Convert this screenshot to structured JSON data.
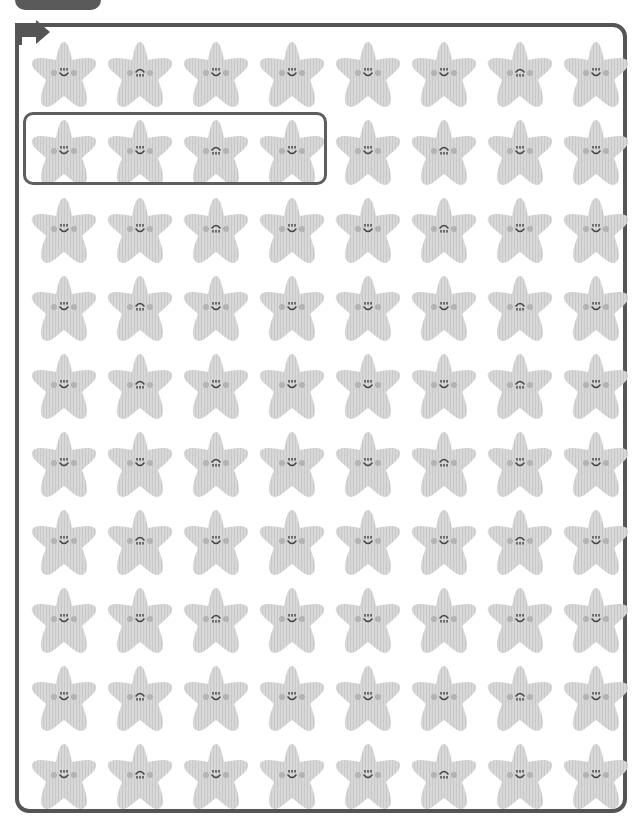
{
  "worksheet": {
    "top_label": "",
    "colors": {
      "frame": "#555555",
      "star_fill": "#d6d6d6",
      "star_stripe": "#c9c9c9",
      "cheek": "#b3b3b3",
      "face_ink": "#444444",
      "highlight_box": "#5e5e5e"
    },
    "grid": {
      "columns": 8,
      "rows": 10
    },
    "highlight": {
      "row": 2,
      "col_start": 1,
      "col_end": 4
    },
    "rows": [
      [
        "smile",
        "inverted",
        "smile",
        "smile",
        "smile",
        "smile",
        "inverted",
        "smile"
      ],
      [
        "smile",
        "smile",
        "inverted",
        "smile",
        "smile",
        "inverted",
        "smile",
        "smile"
      ],
      [
        "smile",
        "smile",
        "inverted",
        "smile",
        "smile",
        "inverted",
        "smile",
        "smile"
      ],
      [
        "smile",
        "inverted",
        "smile",
        "smile",
        "smile",
        "smile",
        "inverted",
        "smile"
      ],
      [
        "smile",
        "inverted",
        "smile",
        "smile",
        "smile",
        "smile",
        "inverted",
        "smile"
      ],
      [
        "smile",
        "smile",
        "inverted",
        "smile",
        "smile",
        "inverted",
        "smile",
        "smile"
      ],
      [
        "smile",
        "inverted",
        "smile",
        "smile",
        "smile",
        "smile",
        "inverted",
        "smile"
      ],
      [
        "smile",
        "smile",
        "inverted",
        "smile",
        "smile",
        "inverted",
        "smile",
        "smile"
      ],
      [
        "smile",
        "inverted",
        "smile",
        "smile",
        "smile",
        "smile",
        "inverted",
        "smile"
      ],
      [
        "smile",
        "inverted",
        "smile",
        "smile",
        "smile",
        "inverted",
        "smile",
        "smile"
      ]
    ]
  }
}
